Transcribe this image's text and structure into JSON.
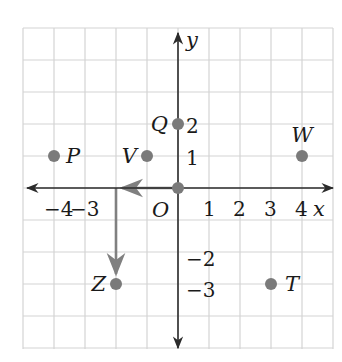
{
  "figure": {
    "type": "coordinate-plane",
    "grid": {
      "x_min": -5,
      "x_max": 5,
      "y_min": -5,
      "y_max": 5,
      "on": true
    },
    "axes": {
      "x_label": "x",
      "y_label": "y",
      "origin_label": "O",
      "x_ticks": [
        {
          "value": -4,
          "label": "−4"
        },
        {
          "value": -3,
          "label": "−3"
        },
        {
          "value": 1,
          "label": "1"
        },
        {
          "value": 2,
          "label": "2"
        },
        {
          "value": 3,
          "label": "3"
        },
        {
          "value": 4,
          "label": "4"
        }
      ],
      "y_ticks": [
        {
          "value": 2,
          "label": "2"
        },
        {
          "value": 1,
          "label": "1"
        },
        {
          "value": -2,
          "label": "−2"
        },
        {
          "value": -3,
          "label": "−3"
        }
      ]
    },
    "points": [
      {
        "name": "P",
        "x": -4,
        "y": 1
      },
      {
        "name": "V",
        "x": -1,
        "y": 1
      },
      {
        "name": "Q",
        "x": 0,
        "y": 2
      },
      {
        "name": "W",
        "x": 4,
        "y": 1
      },
      {
        "name": "O",
        "x": 0,
        "y": 0
      },
      {
        "name": "Z",
        "x": -2,
        "y": -3
      },
      {
        "name": "T",
        "x": 3,
        "y": -3
      }
    ],
    "path": {
      "description": "From O move left 2 units, then down 3 units to Z",
      "segments": [
        {
          "from": [
            0,
            0
          ],
          "to": [
            -2,
            0
          ]
        },
        {
          "from": [
            -2,
            0
          ],
          "to": [
            -2,
            -3
          ]
        }
      ]
    },
    "colors": {
      "grid": "#d4d4d4",
      "axis": "#2b2b2b",
      "point": "#7a7a7a",
      "path": "#808080",
      "text": "#1a1a1a"
    }
  }
}
